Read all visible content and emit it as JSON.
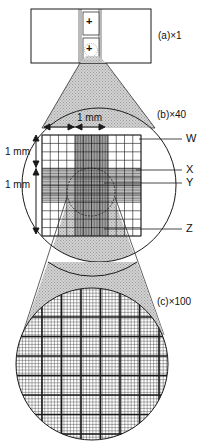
{
  "figure": {
    "panels": [
      {
        "id": "a",
        "label": "(a)×1",
        "magnification": "×1"
      },
      {
        "id": "b",
        "label": "(b)×40",
        "magnification": "×40"
      },
      {
        "id": "c",
        "label": "(c)×100",
        "magnification": "×100"
      }
    ],
    "dimensions": {
      "horizontal": "1 mm",
      "vertical_top": "1 mm",
      "vertical_bottom": "1 mm"
    },
    "callouts": [
      {
        "id": "W",
        "label": "W"
      },
      {
        "id": "X",
        "label": "X"
      },
      {
        "id": "Y",
        "label": "Y"
      },
      {
        "id": "Z",
        "label": "Z"
      }
    ],
    "slide_marks": [
      "+",
      "+"
    ],
    "colors": {
      "line": "#1a1a1a",
      "shade": "#c8c8c8",
      "dark_band": "#8c8c8c",
      "background": "#ffffff"
    }
  }
}
